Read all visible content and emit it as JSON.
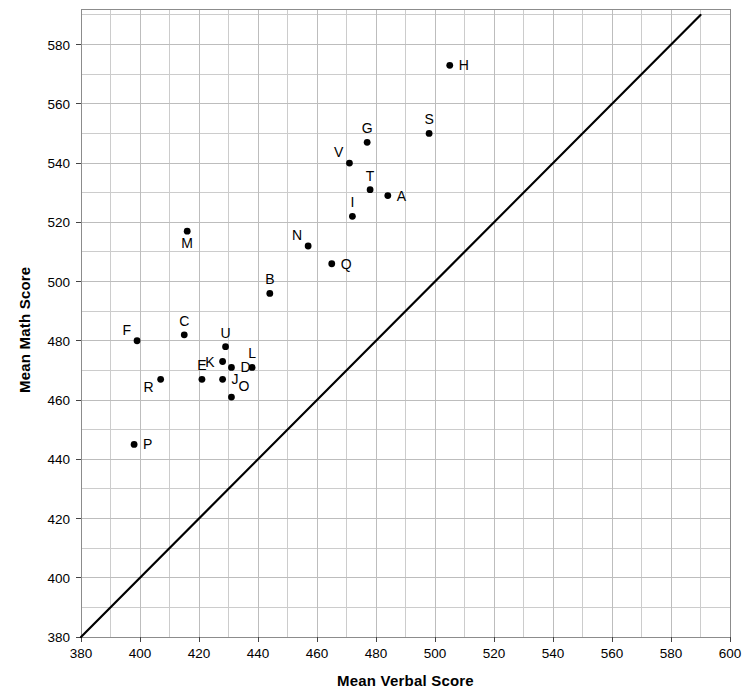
{
  "chart_data": {
    "type": "scatter",
    "title": "",
    "xlabel": "Mean Verbal Score",
    "ylabel": "Mean Math Score",
    "xlim": [
      380,
      600
    ],
    "ylim": [
      380,
      592
    ],
    "xticks": [
      380,
      400,
      420,
      440,
      460,
      480,
      500,
      520,
      540,
      560,
      580,
      600
    ],
    "yticks": [
      380,
      400,
      420,
      440,
      460,
      480,
      500,
      520,
      540,
      560,
      580
    ],
    "xtick_labels": [
      "380",
      "400",
      "420",
      "440",
      "460",
      "480",
      "500",
      "520",
      "540",
      "560",
      "580",
      "600"
    ],
    "ytick_labels": [
      "380",
      "400",
      "420",
      "440",
      "460",
      "480",
      "500",
      "520",
      "540",
      "560",
      "580"
    ],
    "grid": true,
    "grid_minor_step": 10,
    "legend": "none",
    "annotations": [
      {
        "name": "reference-line",
        "type": "line",
        "label": "y = x identity line",
        "from": [
          380,
          380
        ],
        "to": [
          590,
          590
        ]
      }
    ],
    "points": [
      {
        "label": "A",
        "x": 484,
        "y": 529,
        "label_pos": "right"
      },
      {
        "label": "B",
        "x": 444,
        "y": 496,
        "label_pos": "above"
      },
      {
        "label": "C",
        "x": 415,
        "y": 482,
        "label_pos": "above"
      },
      {
        "label": "D",
        "x": 431,
        "y": 471,
        "label_pos": "right"
      },
      {
        "label": "E",
        "x": 421,
        "y": 467,
        "label_pos": "above"
      },
      {
        "label": "F",
        "x": 399,
        "y": 480,
        "label_pos": "above-left"
      },
      {
        "label": "G",
        "x": 477,
        "y": 547,
        "label_pos": "above"
      },
      {
        "label": "H",
        "x": 505,
        "y": 573,
        "label_pos": "right"
      },
      {
        "label": "I",
        "x": 472,
        "y": 522,
        "label_pos": "above"
      },
      {
        "label": "J",
        "x": 428,
        "y": 467,
        "label_pos": "right"
      },
      {
        "label": "K",
        "x": 428,
        "y": 473,
        "label_pos": "left"
      },
      {
        "label": "L",
        "x": 438,
        "y": 471,
        "label_pos": "above"
      },
      {
        "label": "M",
        "x": 416,
        "y": 517,
        "label_pos": "below"
      },
      {
        "label": "N",
        "x": 457,
        "y": 512,
        "label_pos": "above-left"
      },
      {
        "label": "O",
        "x": 431,
        "y": 461,
        "label_pos": "above-right"
      },
      {
        "label": "P",
        "x": 398,
        "y": 445,
        "label_pos": "right"
      },
      {
        "label": "Q",
        "x": 465,
        "y": 506,
        "label_pos": "right"
      },
      {
        "label": "R",
        "x": 407,
        "y": 467,
        "label_pos": "below-left"
      },
      {
        "label": "S",
        "x": 498,
        "y": 550,
        "label_pos": "above"
      },
      {
        "label": "T",
        "x": 478,
        "y": 531,
        "label_pos": "above"
      },
      {
        "label": "U",
        "x": 429,
        "y": 478,
        "label_pos": "above"
      },
      {
        "label": "V",
        "x": 471,
        "y": 540,
        "label_pos": "above-left"
      }
    ]
  },
  "axis": {
    "x_title": "Mean Verbal Score",
    "y_title": "Mean Math Score"
  },
  "colors": {
    "point": "#000000",
    "line": "#000000",
    "grid": "#cccccc",
    "frame": "#8c8c8c",
    "text": "#000000",
    "background": "#ffffff"
  }
}
